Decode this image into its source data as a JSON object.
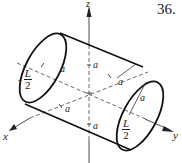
{
  "problem_number": "36.",
  "axes": {
    "x": "x",
    "y": "y",
    "z": "z"
  },
  "dimension_labels": {
    "a_label": "a",
    "left_fraction": {
      "sign": "-",
      "numerator": "L",
      "denominator": "2"
    },
    "right_fraction": {
      "numerator": "L",
      "denominator": "2"
    }
  },
  "figure": {
    "stroke_color": "#111111",
    "axis_color": "#333333"
  }
}
